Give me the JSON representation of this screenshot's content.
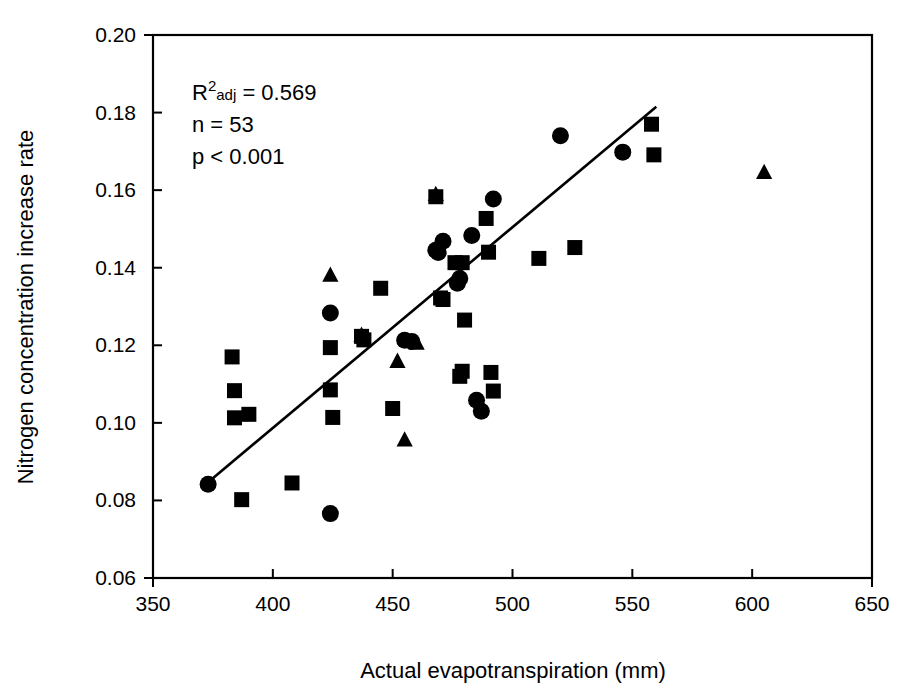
{
  "chart_data": {
    "type": "scatter",
    "title": "",
    "xlabel": "Actual evapotranspiration (mm)",
    "ylabel": "Nitrogen concentration increase rate",
    "xlim": [
      350,
      650
    ],
    "ylim": [
      0.06,
      0.2
    ],
    "xticks": [
      350,
      400,
      450,
      500,
      550,
      600,
      650
    ],
    "xtick_labels": [
      "350",
      "400",
      "450",
      "500",
      "550",
      "600",
      "650"
    ],
    "yticks": [
      0.06,
      0.08,
      0.1,
      0.12,
      0.14,
      0.16,
      0.18,
      0.2
    ],
    "ytick_labels": [
      "0.06",
      "0.08",
      "0.10",
      "0.12",
      "0.14",
      "0.16",
      "0.18",
      "0.20"
    ],
    "grid": false,
    "legend": false,
    "marker_color": "#000000",
    "annotations": {
      "r2_prefix": "R",
      "r2_superscript": "2",
      "r2_subscript": "adj",
      "r2_value": " = 0.569",
      "n_text": "n = 53",
      "p_text": "p < 0.001"
    },
    "fit_line": {
      "label": "regression-line",
      "x_start": 372.0,
      "y_start": 0.0842,
      "x_end": 560.0,
      "y_end": 0.1815
    },
    "series": [
      {
        "name": "squares",
        "marker": "square",
        "points": [
          [
            383,
            0.117
          ],
          [
            384,
            0.1083
          ],
          [
            384,
            0.1013
          ],
          [
            390,
            0.1022
          ],
          [
            387,
            0.0802
          ],
          [
            408,
            0.0845
          ],
          [
            424,
            0.1085
          ],
          [
            424,
            0.1194
          ],
          [
            425,
            0.1014
          ],
          [
            437,
            0.1223
          ],
          [
            438,
            0.1214
          ],
          [
            445,
            0.1347
          ],
          [
            450,
            0.1037
          ],
          [
            468,
            0.1583
          ],
          [
            470,
            0.1322
          ],
          [
            471,
            0.1318
          ],
          [
            476,
            0.1413
          ],
          [
            479,
            0.1413
          ],
          [
            480,
            0.1265
          ],
          [
            478,
            0.112
          ],
          [
            479,
            0.1133
          ],
          [
            490,
            0.144
          ],
          [
            489,
            0.1527
          ],
          [
            491,
            0.113
          ],
          [
            492,
            0.1082
          ],
          [
            511,
            0.1424
          ],
          [
            526,
            0.1452
          ],
          [
            558,
            0.177
          ],
          [
            559,
            0.1691
          ]
        ]
      },
      {
        "name": "circles",
        "marker": "circle",
        "points": [
          [
            373,
            0.0842
          ],
          [
            424,
            0.0766
          ],
          [
            424,
            0.1283
          ],
          [
            455,
            0.1213
          ],
          [
            458,
            0.121
          ],
          [
            468,
            0.1445
          ],
          [
            469,
            0.1439
          ],
          [
            471,
            0.1468
          ],
          [
            477,
            0.136
          ],
          [
            478,
            0.1372
          ],
          [
            483,
            0.1483
          ],
          [
            485,
            0.1058
          ],
          [
            487,
            0.103
          ],
          [
            492,
            0.1577
          ],
          [
            520,
            0.174
          ],
          [
            546,
            0.1698
          ]
        ]
      },
      {
        "name": "triangles",
        "marker": "triangle",
        "points": [
          [
            424,
            0.138
          ],
          [
            437,
            0.1225
          ],
          [
            452,
            0.1158
          ],
          [
            455,
            0.0955
          ],
          [
            460,
            0.1205
          ],
          [
            468,
            0.1588
          ],
          [
            605,
            0.1645
          ]
        ]
      }
    ]
  }
}
